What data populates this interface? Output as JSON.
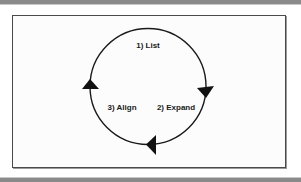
{
  "diagram": {
    "type": "cycle",
    "steps": [
      {
        "label": "1) List"
      },
      {
        "label": "2) Expand"
      },
      {
        "label": "3) Align"
      }
    ],
    "direction": "clockwise",
    "colors": {
      "stroke": "#1a1a1a",
      "frame": "#4a4a4a",
      "rule": "#8a8a8a",
      "background": "#ffffff"
    }
  }
}
